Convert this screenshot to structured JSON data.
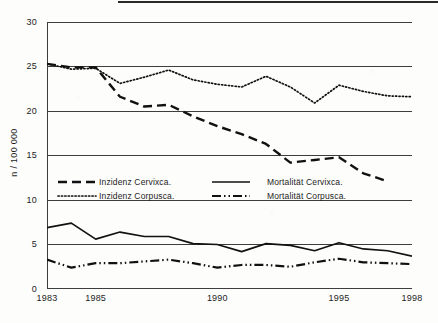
{
  "figure": {
    "y_axis_title": "n / 100 000"
  },
  "chart_data": {
    "type": "line",
    "title": "",
    "subtitle": "",
    "xlabel": "",
    "ylabel": "n / 100 000",
    "xlim": [
      1983,
      1998
    ],
    "ylim": [
      0,
      30
    ],
    "yticks": [
      0,
      5,
      10,
      15,
      20,
      25,
      30
    ],
    "ytick_labels": [
      "0",
      "5",
      "10",
      "15",
      "20",
      "25",
      "30"
    ],
    "xticks": [
      1983,
      1984,
      1985,
      1986,
      1987,
      1988,
      1989,
      1990,
      1991,
      1992,
      1993,
      1994,
      1995,
      1996,
      1997,
      1998
    ],
    "xtick_labels": [
      "1983",
      "1985",
      "1990",
      "1995",
      "1998"
    ],
    "xtick_label_values": [
      1983,
      1985,
      1990,
      1995,
      1998
    ],
    "grid": "horizontal",
    "legend_position": "center-left",
    "x": [
      1983,
      1984,
      1985,
      1986,
      1987,
      1988,
      1989,
      1990,
      1991,
      1992,
      1993,
      1994,
      1995,
      1996,
      1997,
      1998
    ],
    "series": [
      {
        "name": "Inzidenz Cervixca.",
        "style": "dashed",
        "color": "#111111",
        "values": [
          25.3,
          24.9,
          24.9,
          21.6,
          20.5,
          20.7,
          19.4,
          18.3,
          17.4,
          16.3,
          14.2,
          14.5,
          14.8,
          13.0,
          12.1,
          null
        ]
      },
      {
        "name": "Inzidenz Corpusca.",
        "style": "dotted",
        "color": "#111111",
        "values": [
          25.3,
          24.7,
          24.8,
          23.1,
          23.8,
          24.6,
          23.5,
          23.0,
          22.7,
          23.9,
          22.7,
          20.9,
          22.9,
          22.2,
          21.7,
          21.6
        ]
      },
      {
        "name": "Mortalität Cervixca.",
        "style": "solid",
        "color": "#111111",
        "values": [
          6.9,
          7.4,
          5.6,
          6.4,
          5.9,
          5.9,
          5.1,
          5.0,
          4.2,
          5.1,
          4.9,
          4.3,
          5.2,
          4.5,
          4.3,
          3.7
        ]
      },
      {
        "name": "Mortalität Corpusca.",
        "style": "dash-dot-dot",
        "color": "#111111",
        "values": [
          3.3,
          2.4,
          2.9,
          2.9,
          3.1,
          3.3,
          2.9,
          2.4,
          2.7,
          2.7,
          2.5,
          3.0,
          3.4,
          3.0,
          2.9,
          2.8
        ]
      }
    ]
  },
  "legend": {
    "entries": [
      {
        "label": "Inzidenz Cervixca.",
        "style": "dashed"
      },
      {
        "label": "Inzidenz Corpusca.",
        "style": "dotted"
      },
      {
        "label": "Mortalität Cervixca.",
        "style": "solid"
      },
      {
        "label": "Mortalität Corpusca.",
        "style": "dash-dot-dot"
      }
    ]
  }
}
